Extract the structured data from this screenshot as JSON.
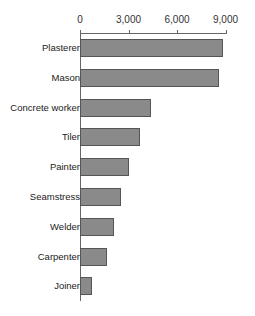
{
  "chart_data": {
    "type": "bar",
    "orientation": "horizontal",
    "title": "",
    "xlabel": "",
    "ylabel": "",
    "xlim": [
      0,
      9000
    ],
    "x_ticks": [
      0,
      3000,
      6000,
      9000
    ],
    "x_tick_labels": [
      "0",
      "3,000",
      "6,000",
      "9,000"
    ],
    "axis_position": "top",
    "grid": false,
    "legend": null,
    "categories": [
      "Plasterer",
      "Mason",
      "Concrete worker",
      "Tiler",
      "Painter",
      "Seamstress",
      "Welder",
      "Carpenter",
      "Joiner"
    ],
    "values": [
      8820,
      8600,
      4400,
      3700,
      3000,
      2550,
      2100,
      1700,
      750
    ],
    "bar_color": "#8a8a8a",
    "bar_edge_color": "#555555"
  }
}
